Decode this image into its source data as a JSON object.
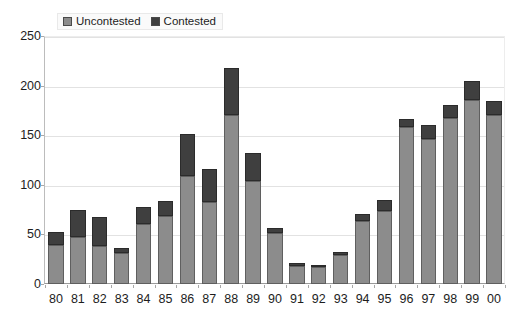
{
  "chart_data": {
    "type": "bar",
    "stacked": true,
    "title": "",
    "subtitle": "",
    "xlabel": "",
    "ylabel": "",
    "ylim": [
      0,
      250
    ],
    "yticks": [
      0,
      50,
      100,
      150,
      200,
      250
    ],
    "grid": true,
    "legend_position": "top-left",
    "categories": [
      "80",
      "81",
      "82",
      "83",
      "84",
      "85",
      "86",
      "87",
      "88",
      "89",
      "90",
      "91",
      "92",
      "93",
      "94",
      "95",
      "96",
      "97",
      "98",
      "99",
      "00"
    ],
    "series": [
      {
        "name": "Uncontested",
        "color": "#8c8c8c",
        "values": [
          39,
          47,
          38,
          31,
          61,
          69,
          109,
          83,
          170,
          104,
          51,
          18,
          17,
          29,
          64,
          74,
          158,
          146,
          167,
          186,
          170
        ]
      },
      {
        "name": "Contested",
        "color": "#3f3f3f",
        "values": [
          13,
          28,
          30,
          5,
          17,
          15,
          42,
          33,
          48,
          28,
          5,
          3,
          2,
          3,
          7,
          11,
          8,
          14,
          13,
          19,
          15
        ]
      }
    ],
    "totals": [
      52,
      75,
      68,
      36,
      78,
      84,
      151,
      116,
      218,
      132,
      56,
      21,
      19,
      32,
      71,
      85,
      166,
      160,
      180,
      205,
      185
    ]
  },
  "legend": {
    "entries": [
      {
        "label": "Uncontested",
        "color": "#8c8c8c"
      },
      {
        "label": "Contested",
        "color": "#3f3f3f"
      }
    ]
  }
}
